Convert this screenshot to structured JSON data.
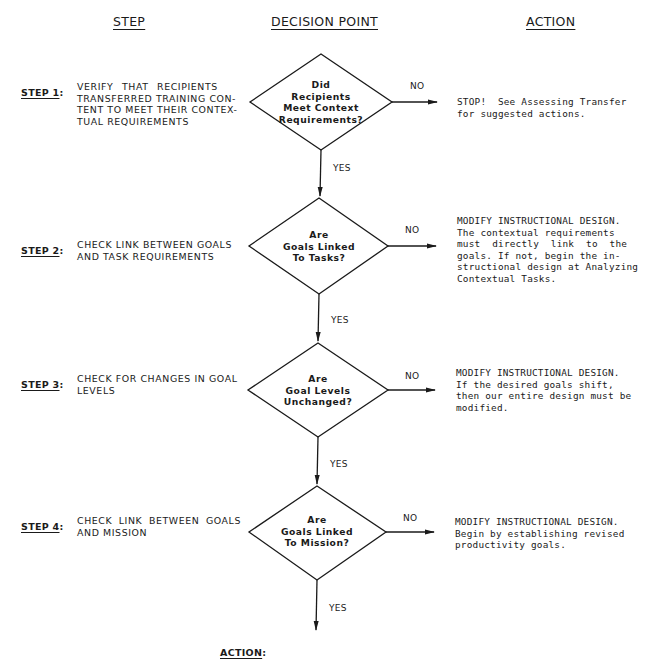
{
  "headers": {
    "step": "STEP",
    "decision_point": "DECISION POINT",
    "action": "ACTION"
  },
  "steps": [
    {
      "label": "STEP 1",
      "colon": ":",
      "text": "VERIFY THAT RECIPIENTS TRANSFERRED TRAINING CON-TENT TO MEET THEIR CONTEX-TUAL REQUIREMENTS",
      "lines": [
        "VERIFY  THAT  RECIPIENTS",
        "TRANSFERRED TRAINING CON-",
        "TENT TO MEET THEIR CONTEX-",
        "TUAL REQUIREMENTS"
      ],
      "decision": [
        "Did",
        "Recipients",
        "Meet Context",
        "Requirements?"
      ],
      "no_label": "NO",
      "yes_label": "YES",
      "action_lines": [
        "STOP!  See Assessing Transfer",
        "for suggested actions."
      ]
    },
    {
      "label": "STEP 2",
      "colon": ":",
      "lines": [
        "CHECK LINK BETWEEN GOALS",
        "AND TASK REQUIREMENTS"
      ],
      "decision": [
        "Are",
        "Goals Linked",
        "To Tasks?"
      ],
      "no_label": "NO",
      "yes_label": "YES",
      "action_lines": [
        "MODIFY INSTRUCTIONAL DESIGN.",
        "The contextual requirements",
        "must directly link to the",
        "goals. If not, begin the in-",
        "structional design at Analyzing",
        "Contextual Tasks."
      ]
    },
    {
      "label": "STEP 3",
      "colon": ":",
      "lines": [
        "CHECK FOR CHANGES IN GOAL",
        "LEVELS"
      ],
      "decision": [
        "Are",
        "Goal Levels",
        "Unchanged?"
      ],
      "no_label": "NO",
      "yes_label": "YES",
      "action_lines": [
        "MODIFY INSTRUCTIONAL DESIGN.",
        "If the desired goals shift,",
        "then our entire design must be",
        "modified."
      ]
    },
    {
      "label": "STEP 4",
      "colon": ":",
      "lines": [
        "CHECK LINK BETWEEN GOALS",
        "AND MISSION"
      ],
      "decision": [
        "Are",
        "Goals Linked",
        "To Mission?"
      ],
      "no_label": "NO",
      "yes_label": "YES",
      "action_lines": [
        "MODIFY INSTRUCTIONAL DESIGN.",
        "Begin by establishing revised",
        "productivity goals."
      ]
    }
  ],
  "final": {
    "label": "ACTION",
    "colon": ":"
  },
  "colors": {
    "ink": "#1a1a1a",
    "background": "#ffffff"
  }
}
